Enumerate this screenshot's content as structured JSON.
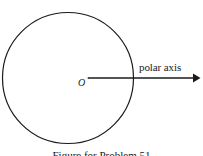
{
  "figure": {
    "background_color": "#ffffff",
    "stroke_color": "#1a1a1a",
    "origin_label": "O",
    "polar_axis_label": "polar axis",
    "caption": "Figure for Problem 51",
    "circle": {
      "center_x": 68,
      "center_y": 78,
      "radius": 66,
      "stroke_width": 1.2
    },
    "ray": {
      "start_x": 88,
      "start_y": 78,
      "end_x": 200,
      "end_y": 78,
      "stroke_width": 1.6,
      "arrowhead": "solid-triangle"
    }
  }
}
